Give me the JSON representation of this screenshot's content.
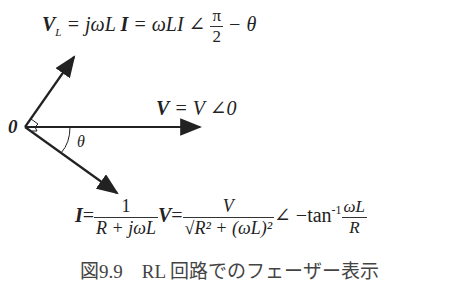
{
  "diagram": {
    "origin_label": "0",
    "theta_label": "θ",
    "vl_eq": {
      "lhs": "V",
      "sub": "L",
      "eq1": " = jωL ",
      "I": "I",
      "eq2": " = ωLI ∠ ",
      "pi": "π",
      "two": "2",
      "tail": " − θ"
    },
    "v_eq": {
      "V": "V",
      "rest": " = V ∠0"
    },
    "i_eq": {
      "I": "I",
      "eq": "=",
      "one": "1",
      "den1": "R + jωL",
      "V": "V",
      "eq2": "=",
      "num2": "V",
      "den2": "√R² + (ωL)²",
      "angle": "∠ −tan",
      "inv": "-1",
      "num3": "ωL",
      "den3": "R"
    },
    "caption": "図9.9　RL 回路でのフェーザー表示"
  }
}
